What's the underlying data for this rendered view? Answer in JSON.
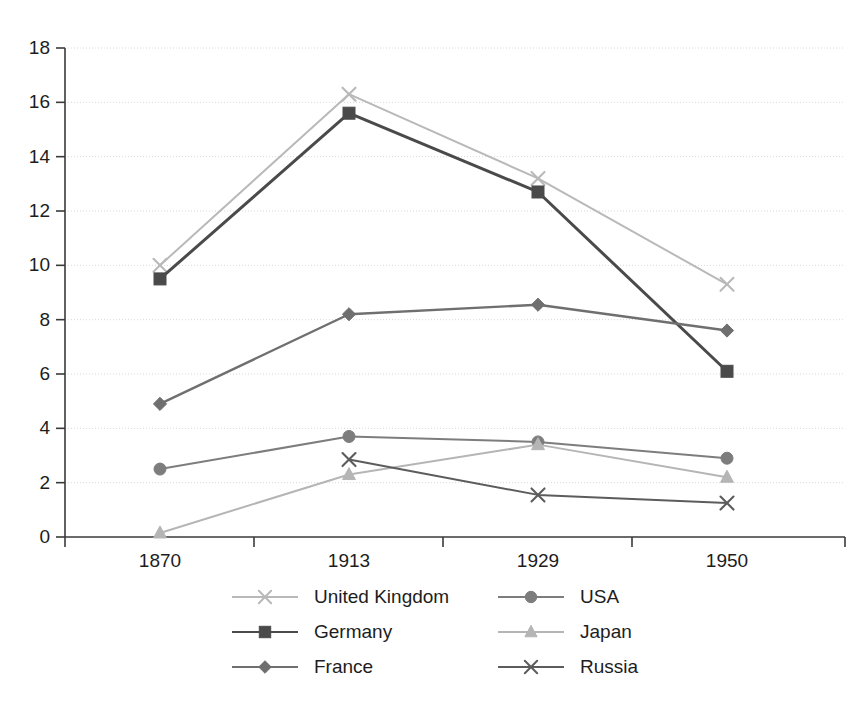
{
  "chart_data": {
    "type": "line",
    "title": "",
    "subtitle": "",
    "xlabel": "",
    "ylabel": "",
    "categories": [
      "1870",
      "1913",
      "1929",
      "1950"
    ],
    "ylim": [
      0,
      18
    ],
    "yticks": [
      0,
      2,
      4,
      6,
      8,
      10,
      12,
      14,
      16,
      18
    ],
    "ytick_labels": [
      "0",
      "2",
      "4",
      "6",
      "8",
      "10",
      "12",
      "14",
      "16",
      "18"
    ],
    "grid": true,
    "grid_axis": "y",
    "legend_position": "bottom",
    "legend_columns": 2,
    "series": [
      {
        "name": "United Kingdom",
        "marker": "x",
        "color": "#b9b9b9",
        "values": [
          10.0,
          16.3,
          13.2,
          9.3
        ]
      },
      {
        "name": "Germany",
        "marker": "square",
        "color": "#4a4a4a",
        "values": [
          9.5,
          15.6,
          12.7,
          6.1
        ]
      },
      {
        "name": "France",
        "marker": "diamond",
        "color": "#6f6f6f",
        "values": [
          4.9,
          8.2,
          8.55,
          7.6
        ]
      },
      {
        "name": "USA",
        "marker": "circle",
        "color": "#7d7d7d",
        "values": [
          2.5,
          3.7,
          3.5,
          2.9
        ]
      },
      {
        "name": "Japan",
        "marker": "triangle",
        "color": "#b5b5b5",
        "values": [
          0.15,
          2.3,
          3.4,
          2.2
        ]
      },
      {
        "name": "Russia",
        "marker": "x",
        "color": "#5c5c5c",
        "values": [
          null,
          2.85,
          1.55,
          1.25
        ]
      }
    ]
  },
  "legend": {
    "entries": [
      {
        "label": "United Kingdom"
      },
      {
        "label": "USA"
      },
      {
        "label": "Germany"
      },
      {
        "label": "Japan"
      },
      {
        "label": "France"
      },
      {
        "label": "Russia"
      }
    ]
  },
  "colors": {
    "background": "#ffffff",
    "axis": "#3a3a3a",
    "grid": "#d8d8d8",
    "text": "#1d1d1d"
  }
}
